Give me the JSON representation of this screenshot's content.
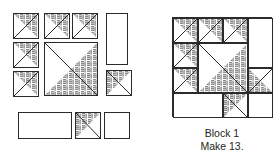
{
  "diagram": {
    "kind": "quilt-block-cutting-diagram",
    "background_color": "#ffffff",
    "line_color": "#2b2b2b",
    "shade_color": "#8c8c8c",
    "shade_fill_name": "gray-crosshatch-texture",
    "unshaded_fill_name": "white-plain"
  },
  "caption": {
    "line1": "Block 1",
    "line2": "Make 13."
  },
  "pieces_group": {
    "label_name": "cut-pieces-group",
    "pieces": [
      {
        "id": "hst-col1-r1",
        "name": "half-square-triangle-shaded-upper-right",
        "x": 13,
        "y": 13,
        "w": 26,
        "h": 26,
        "shape": "hst",
        "shaded_corner": "upper-right"
      },
      {
        "id": "hst-col1-r2",
        "name": "half-square-triangle-shaded-upper-right",
        "x": 13,
        "y": 42,
        "w": 26,
        "h": 26,
        "shape": "hst",
        "shaded_corner": "upper-right"
      },
      {
        "id": "hst-col1-r3",
        "name": "half-square-triangle-shaded-upper-right",
        "x": 13,
        "y": 71,
        "w": 26,
        "h": 26,
        "shape": "hst",
        "shaded_corner": "upper-right"
      },
      {
        "id": "hst-top-a",
        "name": "half-square-triangle-shaded-upper-right",
        "x": 44,
        "y": 13,
        "w": 26,
        "h": 26,
        "shape": "hst",
        "shaded_corner": "upper-right"
      },
      {
        "id": "hst-top-b",
        "name": "half-square-triangle-shaded-upper-right",
        "x": 72,
        "y": 13,
        "w": 26,
        "h": 26,
        "shape": "hst",
        "shaded_corner": "upper-right"
      },
      {
        "id": "hst-large",
        "name": "large-half-square-triangle-shaded-lower-right",
        "x": 44,
        "y": 42,
        "w": 54,
        "h": 54,
        "shape": "hst",
        "shaded_corner": "lower-right"
      },
      {
        "id": "rect-tall",
        "name": "tall-rectangle-plain",
        "x": 106,
        "y": 13,
        "w": 22,
        "h": 52,
        "shape": "plain"
      },
      {
        "id": "hst-right-low",
        "name": "half-square-triangle-shaded-upper-left",
        "x": 106,
        "y": 70,
        "w": 26,
        "h": 26,
        "shape": "hst",
        "shaded_corner": "upper-left"
      },
      {
        "id": "rect-wide",
        "name": "wide-rectangle-plain",
        "x": 18,
        "y": 112,
        "w": 54,
        "h": 27,
        "shape": "plain"
      },
      {
        "id": "hst-bottom",
        "name": "half-square-triangle-shaded-upper-left",
        "x": 75,
        "y": 112,
        "w": 26,
        "h": 27,
        "shape": "hst",
        "shaded_corner": "upper-left"
      },
      {
        "id": "square-bottom",
        "name": "square-plain",
        "x": 104,
        "y": 112,
        "w": 26,
        "h": 27,
        "shape": "plain"
      }
    ]
  },
  "block": {
    "name": "assembled-block-1",
    "x": 172,
    "y": 17,
    "w": 100,
    "h": 100,
    "grid": "4x4",
    "units": [
      {
        "id": "r1c1",
        "name": "half-square-triangle-shaded-upper-right",
        "x": 0,
        "y": 0,
        "w": 25,
        "h": 25,
        "shape": "hst",
        "shaded_corner": "upper-right"
      },
      {
        "id": "r1c2",
        "name": "half-square-triangle-shaded-upper-right",
        "x": 25,
        "y": 0,
        "w": 25,
        "h": 25,
        "shape": "hst",
        "shaded_corner": "upper-right"
      },
      {
        "id": "r1c3",
        "name": "half-square-triangle-shaded-upper-right",
        "x": 50,
        "y": 0,
        "w": 25,
        "h": 25,
        "shape": "hst",
        "shaded_corner": "upper-right"
      },
      {
        "id": "r1c4",
        "name": "tall-rectangle-plain",
        "x": 75,
        "y": 0,
        "w": 25,
        "h": 50,
        "shape": "plain"
      },
      {
        "id": "r2c1",
        "name": "half-square-triangle-shaded-upper-right",
        "x": 0,
        "y": 25,
        "w": 25,
        "h": 25,
        "shape": "hst",
        "shaded_corner": "upper-right"
      },
      {
        "id": "center-large",
        "name": "large-half-square-triangle-shaded-lower-right",
        "x": 25,
        "y": 25,
        "w": 50,
        "h": 50,
        "shape": "hst",
        "shaded_corner": "lower-right"
      },
      {
        "id": "r3c1",
        "name": "half-square-triangle-shaded-upper-right",
        "x": 0,
        "y": 50,
        "w": 25,
        "h": 25,
        "shape": "hst",
        "shaded_corner": "upper-right"
      },
      {
        "id": "r3c4",
        "name": "half-square-triangle-shaded-lower-left",
        "x": 75,
        "y": 50,
        "w": 25,
        "h": 25,
        "shape": "hst",
        "shaded_corner": "lower-left"
      },
      {
        "id": "r4c12",
        "name": "wide-rectangle-plain",
        "x": 0,
        "y": 75,
        "w": 50,
        "h": 25,
        "shape": "plain"
      },
      {
        "id": "r4c3",
        "name": "half-square-triangle-shaded-upper-left",
        "x": 50,
        "y": 75,
        "w": 25,
        "h": 25,
        "shape": "hst",
        "shaded_corner": "upper-left"
      },
      {
        "id": "r4c4",
        "name": "square-plain",
        "x": 75,
        "y": 75,
        "w": 25,
        "h": 25,
        "shape": "plain"
      }
    ]
  }
}
